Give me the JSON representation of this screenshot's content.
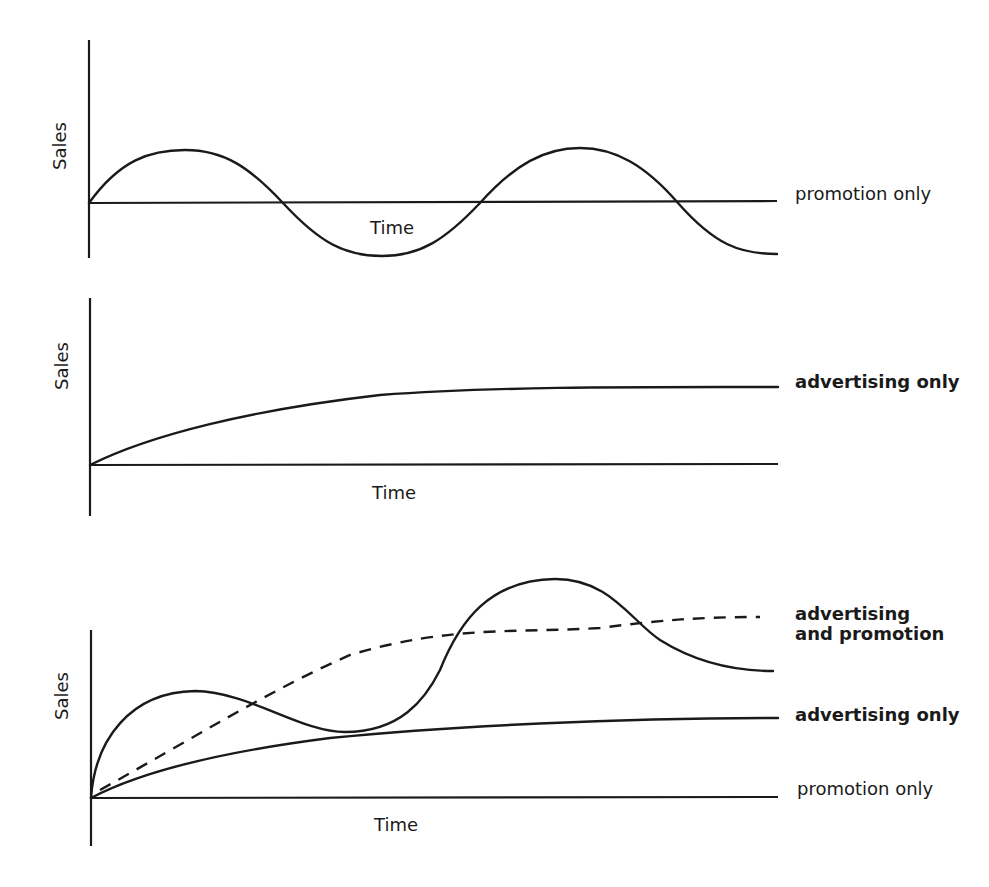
{
  "panels": [
    {
      "id": "promotion-only",
      "y_axis_label": "Sales",
      "x_axis_label": "Time",
      "series": [
        {
          "label": "promotion only",
          "style": "solid",
          "shape": "oscillating"
        }
      ]
    },
    {
      "id": "advertising-only",
      "y_axis_label": "Sales",
      "x_axis_label": "Time",
      "series": [
        {
          "label": "advertising only",
          "style": "solid",
          "shape": "rising-saturating"
        }
      ]
    },
    {
      "id": "combined",
      "y_axis_label": "Sales",
      "x_axis_label": "Time",
      "series": [
        {
          "label": "advertising",
          "label_line2": "and promotion",
          "style": "dashed",
          "shape": "rising-saturating"
        },
        {
          "label": "advertising only",
          "style": "solid",
          "shape": "rising-saturating"
        },
        {
          "label": "promotion only",
          "style": "solid",
          "shape": "baseline"
        }
      ]
    }
  ],
  "colors": {
    "ink": "#1a1a1a",
    "background": "#ffffff"
  }
}
